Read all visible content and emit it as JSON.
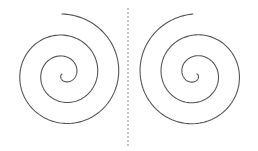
{
  "figure": {
    "width": 258,
    "height": 151,
    "background": "#ffffff",
    "stroke_color": "#555555",
    "divider": {
      "x": 128,
      "y1": 8,
      "y2": 146,
      "color": "#888888",
      "dash": "2,2"
    },
    "spirals": [
      {
        "name": "left-spiral",
        "cx": 64,
        "cy": 74,
        "turns": 2.85,
        "r_max": 60,
        "start_angle_deg": -92,
        "direction": "clockwise-inward",
        "mirror": false
      },
      {
        "name": "right-spiral",
        "cx": 195,
        "cy": 74,
        "turns": 2.85,
        "r_max": 60,
        "start_angle_deg": -92,
        "direction": "counterclockwise-inward",
        "mirror": true
      }
    ]
  }
}
